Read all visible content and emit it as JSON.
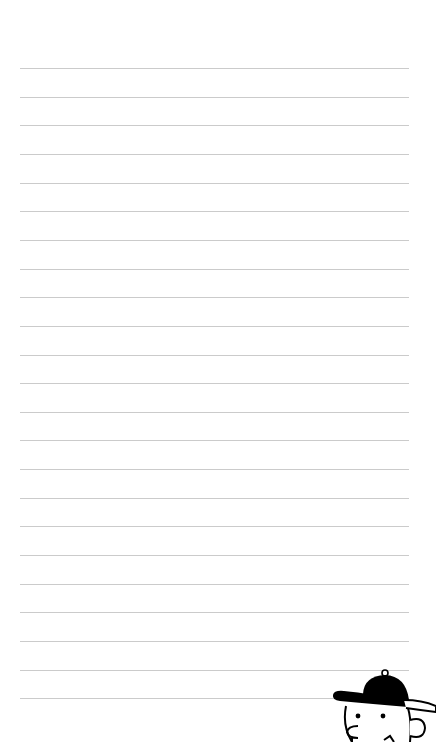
{
  "page": {
    "type": "lined-notebook-paper",
    "background_color": "#ffffff",
    "line_color": "#cbcbcb",
    "line_count": 23,
    "first_line_y": 68,
    "line_spacing": 28.65,
    "line_left": 20,
    "line_right": 409
  },
  "decoration": {
    "icon": "cartoon-boy-with-cap-icon",
    "position": "bottom-right",
    "cap_color": "#000000"
  }
}
